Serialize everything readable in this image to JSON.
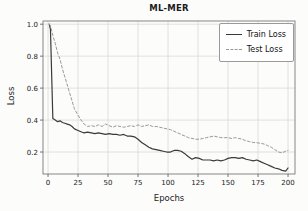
{
  "figure": {
    "title": "ML-MER",
    "xlabel": "Epochs",
    "ylabel": "Loss"
  },
  "legend": {
    "position": "upper right",
    "items": [
      {
        "label": "Train Loss",
        "style": "solid",
        "color": "#3a3a3a"
      },
      {
        "label": "Test Loss",
        "style": "dashed",
        "color": "#999999"
      }
    ]
  },
  "colors": {
    "train_line": "#3a3a3a",
    "test_line": "#999999",
    "gridline": "#d9d9d9",
    "plot_border": "#7a7a7a",
    "tick_text": "#222222",
    "background": "#fcfcfb"
  },
  "chart_data": {
    "type": "line",
    "title": "ML-MER",
    "xlabel": "Epochs",
    "ylabel": "Loss",
    "grid": true,
    "legend_position": "upper right",
    "xlim": [
      -4.2,
      205.8
    ],
    "ylim": [
      0.0625,
      1.02
    ],
    "xticks": [
      0,
      25,
      50,
      75,
      100,
      125,
      150,
      175,
      200
    ],
    "yticks": [
      0.2,
      0.4,
      0.6,
      0.8,
      1.0
    ],
    "x": [
      1,
      2,
      4,
      6,
      8,
      10,
      12,
      14,
      16,
      18,
      20,
      22,
      25,
      28,
      30,
      33,
      36,
      39,
      42,
      45,
      48,
      51,
      54,
      57,
      60,
      63,
      66,
      69,
      72,
      75,
      78,
      81,
      84,
      87,
      90,
      93,
      96,
      99,
      102,
      105,
      108,
      111,
      114,
      117,
      120,
      123,
      126,
      129,
      132,
      135,
      138,
      141,
      144,
      147,
      150,
      153,
      156,
      159,
      162,
      165,
      168,
      171,
      174,
      177,
      180,
      183,
      186,
      189,
      192,
      195,
      198,
      200
    ],
    "series": [
      {
        "name": "Train Loss",
        "color": "#3a3a3a",
        "dash": "solid",
        "values": [
          1.0,
          0.97,
          0.41,
          0.4,
          0.39,
          0.395,
          0.385,
          0.38,
          0.375,
          0.37,
          0.36,
          0.345,
          0.335,
          0.325,
          0.32,
          0.325,
          0.32,
          0.315,
          0.32,
          0.315,
          0.31,
          0.315,
          0.31,
          0.31,
          0.305,
          0.31,
          0.3,
          0.3,
          0.295,
          0.28,
          0.26,
          0.245,
          0.23,
          0.22,
          0.215,
          0.21,
          0.205,
          0.2,
          0.2,
          0.21,
          0.21,
          0.205,
          0.19,
          0.17,
          0.155,
          0.165,
          0.16,
          0.15,
          0.15,
          0.15,
          0.145,
          0.15,
          0.145,
          0.15,
          0.16,
          0.165,
          0.165,
          0.16,
          0.165,
          0.155,
          0.15,
          0.145,
          0.15,
          0.14,
          0.13,
          0.12,
          0.11,
          0.1,
          0.095,
          0.085,
          0.08,
          0.1
        ]
      },
      {
        "name": "Test Loss",
        "color": "#999999",
        "dash": "dashed",
        "values": [
          1.0,
          0.99,
          0.93,
          0.88,
          0.82,
          0.78,
          0.72,
          0.67,
          0.62,
          0.57,
          0.52,
          0.47,
          0.43,
          0.395,
          0.375,
          0.36,
          0.365,
          0.36,
          0.37,
          0.36,
          0.375,
          0.365,
          0.355,
          0.365,
          0.36,
          0.355,
          0.36,
          0.365,
          0.36,
          0.37,
          0.36,
          0.365,
          0.37,
          0.36,
          0.36,
          0.355,
          0.35,
          0.345,
          0.34,
          0.33,
          0.32,
          0.31,
          0.3,
          0.29,
          0.285,
          0.28,
          0.28,
          0.285,
          0.29,
          0.295,
          0.3,
          0.295,
          0.29,
          0.29,
          0.29,
          0.285,
          0.29,
          0.285,
          0.28,
          0.27,
          0.265,
          0.26,
          0.258,
          0.255,
          0.25,
          0.24,
          0.23,
          0.215,
          0.2,
          0.195,
          0.205,
          0.21
        ]
      }
    ]
  }
}
